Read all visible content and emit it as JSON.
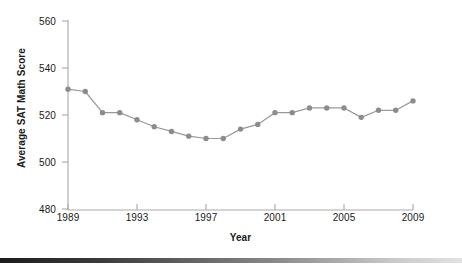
{
  "chart_data": {
    "type": "line",
    "title": "",
    "xlabel": "Year",
    "ylabel": "Average SAT Math Score",
    "xlim": [
      1989,
      2009
    ],
    "ylim": [
      480,
      560
    ],
    "xticks": [
      1989,
      1993,
      1997,
      2001,
      2005,
      2009
    ],
    "xtick_labels": [
      "1989",
      "1993",
      "1997",
      "2001",
      "2005",
      "2009"
    ],
    "yticks": [
      480,
      500,
      520,
      540,
      560
    ],
    "ytick_labels": [
      "480",
      "500",
      "520",
      "540",
      "560"
    ],
    "grid": false,
    "legend": false,
    "marker": "circle",
    "line_color": "#999999",
    "marker_color": "#8c8c8c",
    "axis_color": "#aaaaaa",
    "x": [
      1989,
      1990,
      1991,
      1992,
      1993,
      1994,
      1995,
      1996,
      1997,
      1998,
      1999,
      2000,
      2001,
      2002,
      2003,
      2004,
      2005,
      2006,
      2007,
      2008,
      2009
    ],
    "values": [
      531,
      530,
      521,
      521,
      518,
      515,
      513,
      511,
      510,
      510,
      514,
      516,
      521,
      521,
      523,
      523,
      523,
      519,
      522,
      522,
      526
    ],
    "series": [
      {
        "name": "Average SAT Math Score",
        "values": [
          531,
          530,
          521,
          521,
          518,
          515,
          513,
          511,
          510,
          510,
          514,
          516,
          521,
          521,
          523,
          523,
          523,
          519,
          522,
          522,
          526
        ]
      }
    ]
  },
  "axes": {
    "y_title": "Average SAT Math Score",
    "x_title": "Year"
  },
  "footer": {
    "band_color": "#1c1c1c"
  }
}
